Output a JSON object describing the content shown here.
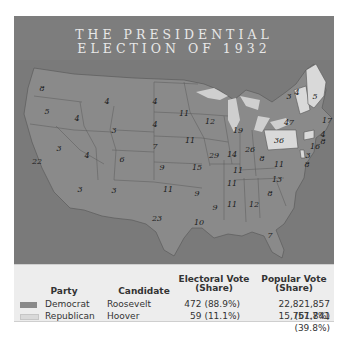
{
  "title": {
    "line1": "THE PRESIDENTIAL",
    "line2": "ELECTION OF 1932"
  },
  "colors": {
    "democrat": "#8a8a8a",
    "republican": "#d9d9d9",
    "water": "#707070",
    "background": "#7d7d7d"
  },
  "map": {
    "states": [
      {
        "abbr": "WA",
        "ev": "8",
        "party": "D",
        "x": 42,
        "y": 88
      },
      {
        "abbr": "OR",
        "ev": "5",
        "party": "D",
        "x": 47,
        "y": 111
      },
      {
        "abbr": "CA",
        "ev": "22",
        "party": "D",
        "x": 37,
        "y": 161
      },
      {
        "abbr": "ID",
        "ev": "4",
        "party": "D",
        "x": 77,
        "y": 118
      },
      {
        "abbr": "NV",
        "ev": "3",
        "party": "D",
        "x": 59,
        "y": 148
      },
      {
        "abbr": "MT",
        "ev": "4",
        "party": "D",
        "x": 107,
        "y": 101
      },
      {
        "abbr": "WY",
        "ev": "3",
        "party": "D",
        "x": 114,
        "y": 130
      },
      {
        "abbr": "UT",
        "ev": "4",
        "party": "D",
        "x": 87,
        "y": 155
      },
      {
        "abbr": "CO",
        "ev": "6",
        "party": "D",
        "x": 122,
        "y": 159
      },
      {
        "abbr": "AZ",
        "ev": "3",
        "party": "D",
        "x": 80,
        "y": 189
      },
      {
        "abbr": "NM",
        "ev": "3",
        "party": "D",
        "x": 114,
        "y": 190
      },
      {
        "abbr": "ND",
        "ev": "4",
        "party": "D",
        "x": 155,
        "y": 101
      },
      {
        "abbr": "SD",
        "ev": "4",
        "party": "D",
        "x": 155,
        "y": 124
      },
      {
        "abbr": "NE",
        "ev": "7",
        "party": "D",
        "x": 155,
        "y": 146
      },
      {
        "abbr": "KS",
        "ev": "9",
        "party": "D",
        "x": 162,
        "y": 167
      },
      {
        "abbr": "OK",
        "ev": "11",
        "party": "D",
        "x": 168,
        "y": 189
      },
      {
        "abbr": "TX",
        "ev": "23",
        "party": "D",
        "x": 157,
        "y": 218
      },
      {
        "abbr": "MN",
        "ev": "11",
        "party": "D",
        "x": 184,
        "y": 113
      },
      {
        "abbr": "IA",
        "ev": "11",
        "party": "D",
        "x": 190,
        "y": 140
      },
      {
        "abbr": "MO",
        "ev": "15",
        "party": "D",
        "x": 197,
        "y": 167
      },
      {
        "abbr": "AR",
        "ev": "9",
        "party": "D",
        "x": 197,
        "y": 193
      },
      {
        "abbr": "LA",
        "ev": "10",
        "party": "D",
        "x": 199,
        "y": 222
      },
      {
        "abbr": "WI",
        "ev": "12",
        "party": "D",
        "x": 210,
        "y": 121
      },
      {
        "abbr": "IL",
        "ev": "29",
        "party": "D",
        "x": 214,
        "y": 155
      },
      {
        "abbr": "MI",
        "ev": "19",
        "party": "D",
        "x": 238,
        "y": 130
      },
      {
        "abbr": "IN",
        "ev": "14",
        "party": "D",
        "x": 232,
        "y": 154
      },
      {
        "abbr": "OH",
        "ev": "26",
        "party": "D",
        "x": 250,
        "y": 149
      },
      {
        "abbr": "KY",
        "ev": "11",
        "party": "D",
        "x": 238,
        "y": 170
      },
      {
        "abbr": "TN",
        "ev": "11",
        "party": "D",
        "x": 232,
        "y": 183
      },
      {
        "abbr": "MS",
        "ev": "9",
        "party": "D",
        "x": 215,
        "y": 207
      },
      {
        "abbr": "AL",
        "ev": "11",
        "party": "D",
        "x": 232,
        "y": 204
      },
      {
        "abbr": "GA",
        "ev": "12",
        "party": "D",
        "x": 254,
        "y": 204
      },
      {
        "abbr": "FL",
        "ev": "7",
        "party": "D",
        "x": 270,
        "y": 235
      },
      {
        "abbr": "SC",
        "ev": "8",
        "party": "D",
        "x": 270,
        "y": 193
      },
      {
        "abbr": "NC",
        "ev": "13",
        "party": "D",
        "x": 277,
        "y": 179
      },
      {
        "abbr": "VA",
        "ev": "11",
        "party": "D",
        "x": 279,
        "y": 164
      },
      {
        "abbr": "WV",
        "ev": "8",
        "party": "D",
        "x": 262,
        "y": 158
      },
      {
        "abbr": "PA",
        "ev": "36",
        "party": "R",
        "x": 279,
        "y": 140
      },
      {
        "abbr": "NY",
        "ev": "47",
        "party": "D",
        "x": 289,
        "y": 122
      },
      {
        "abbr": "MD",
        "ev": "8",
        "party": "D",
        "x": 307,
        "y": 164
      },
      {
        "abbr": "DE",
        "ev": "3",
        "party": "R",
        "x": 308,
        "y": 155
      },
      {
        "abbr": "NJ",
        "ev": "16",
        "party": "D",
        "x": 315,
        "y": 146
      },
      {
        "abbr": "CT",
        "ev": "8",
        "party": "R",
        "x": 323,
        "y": 141
      },
      {
        "abbr": "RI",
        "ev": "4",
        "party": "D",
        "x": 323,
        "y": 134
      },
      {
        "abbr": "MA",
        "ev": "17",
        "party": "D",
        "x": 327,
        "y": 120
      },
      {
        "abbr": "VT",
        "ev": "3",
        "party": "R",
        "x": 289,
        "y": 96
      },
      {
        "abbr": "NH",
        "ev": "4",
        "party": "R",
        "x": 297,
        "y": 92
      },
      {
        "abbr": "ME",
        "ev": "5",
        "party": "R",
        "x": 315,
        "y": 96
      }
    ]
  },
  "legend": {
    "headers": {
      "party": "Party",
      "candidate": "Candidate",
      "electoral": "Electoral Vote\n(Share)",
      "electoral_l1": "Electoral Vote",
      "electoral_l2": "(Share)",
      "popular_l1": "Popular Vote",
      "popular_l2": "(Share)"
    },
    "rows": [
      {
        "party": "Democrat",
        "candidate": "Roosevelt",
        "electoral": "472 (88.9%)",
        "popular": "22,821,857 (57.7%)",
        "color": "#8a8a8a"
      },
      {
        "party": "Republican",
        "candidate": "Hoover",
        "electoral": "59 (11.1%)",
        "popular": "15,761,841 (39.8%)",
        "color": "#d9d9d9"
      }
    ]
  }
}
